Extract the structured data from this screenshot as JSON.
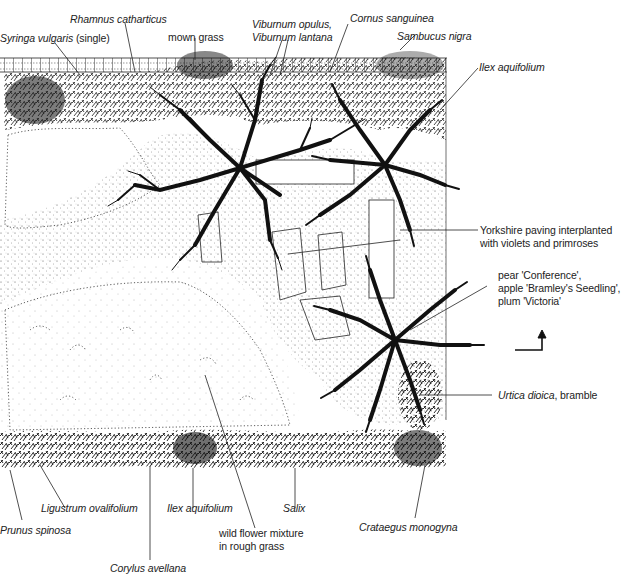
{
  "diagram": {
    "type": "garden-plan",
    "north_arrow": "north-arrow-icon",
    "colors": {
      "ink": "#1a1a1a",
      "paper": "#ffffff",
      "stipple": "#555555"
    }
  },
  "labels": {
    "top": [
      {
        "id": "syringa",
        "species": "Syringa vulgaris",
        "note": "(single)",
        "display_prefix": "Syringa vulgaris",
        "display_suffix": " (single)"
      },
      {
        "id": "rhamnus",
        "species": "Rhamnus catharticus"
      },
      {
        "id": "mown_grass",
        "text": "mown grass"
      },
      {
        "id": "viburnum",
        "line1": "Viburnum opulus,",
        "line2": "Viburnum lantana"
      },
      {
        "id": "cornus",
        "species": "Cornus sanguinea"
      },
      {
        "id": "sambucus",
        "species": "Sambucus nigra"
      }
    ],
    "right": [
      {
        "id": "ilex_top",
        "species": "Ilex aquifolium"
      },
      {
        "id": "paving",
        "line1": "Yorkshire paving interplanted",
        "line2": "with violets and primroses"
      },
      {
        "id": "fruit",
        "line1": "pear 'Conference',",
        "line2": "apple 'Bramley's Seedling',",
        "line3": "plum 'Victoria'"
      },
      {
        "id": "urtica",
        "species": "Urtica dioica",
        "suffix": ", bramble"
      }
    ],
    "bottom": [
      {
        "id": "prunus",
        "species": "Prunus spinosa"
      },
      {
        "id": "ligustrum",
        "species": "Ligustrum ovalifolium"
      },
      {
        "id": "ilex_bottom",
        "species": "Ilex aquifolium"
      },
      {
        "id": "salix",
        "species": "Salix"
      },
      {
        "id": "wildflower",
        "line1": "wild flower mixture",
        "line2": "in rough grass"
      },
      {
        "id": "crataegus",
        "species": "Crataegus monogyna"
      },
      {
        "id": "corylus",
        "species": "Corylus avellana"
      }
    ]
  }
}
